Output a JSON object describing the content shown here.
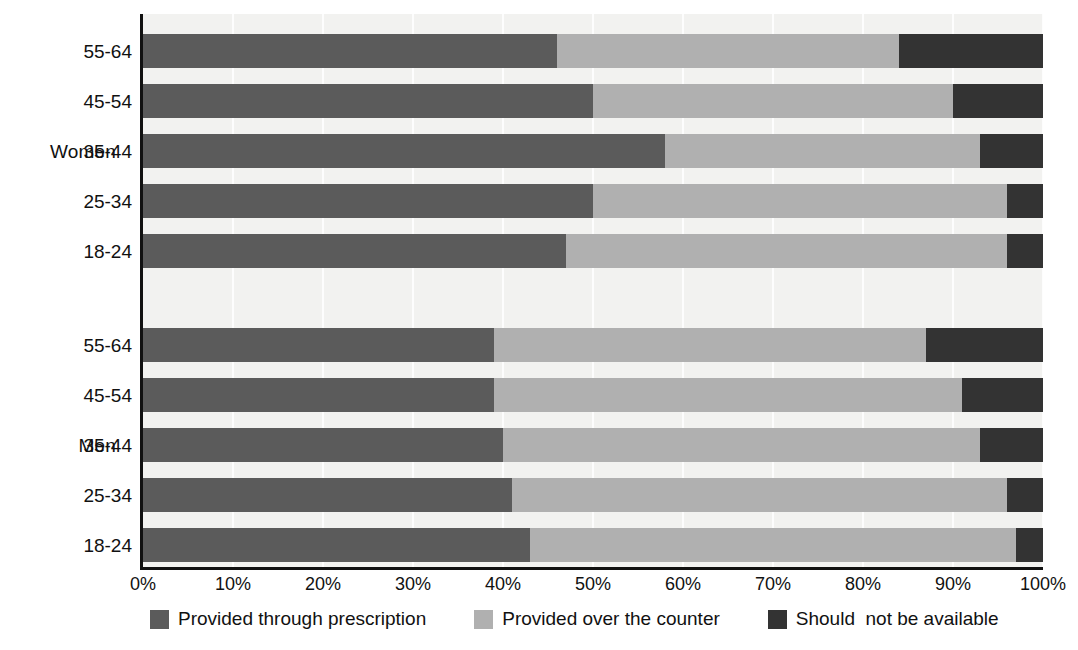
{
  "chart_data": {
    "type": "bar",
    "orientation": "horizontal",
    "stacked": true,
    "stacked_mode": "percent",
    "title": "",
    "subtitle": "",
    "xlabel": "",
    "ylabel": "",
    "xlim": [
      0,
      100
    ],
    "xtick_labels": [
      "0%",
      "10%",
      "20%",
      "30%",
      "40%",
      "50%",
      "60%",
      "70%",
      "80%",
      "90%",
      "100%"
    ],
    "xticks": [
      0,
      10,
      20,
      30,
      40,
      50,
      60,
      70,
      80,
      90,
      100
    ],
    "grid": true,
    "grid_axis": "x",
    "legend_position": "bottom",
    "groups": [
      "Women",
      "Men"
    ],
    "categories": [
      "55-64",
      "45-54",
      "35-44",
      "25-34",
      "18-24"
    ],
    "series": [
      {
        "name": "Provided through prescription",
        "color": "#5b5b5b",
        "values_women": [
          46,
          50,
          58,
          50,
          47
        ],
        "values_men": [
          39,
          39,
          40,
          41,
          43
        ]
      },
      {
        "name": "Provided over the counter",
        "color": "#b0b0b0",
        "values_women": [
          38,
          40,
          35,
          46,
          49
        ],
        "values_men": [
          48,
          52,
          53,
          55,
          54
        ]
      },
      {
        "name": "Should  not be available",
        "color": "#333333",
        "values_women": [
          16,
          10,
          7,
          4,
          4
        ],
        "values_men": [
          13,
          9,
          7,
          4,
          3
        ]
      }
    ],
    "bars": [
      {
        "group": "Women",
        "category": "55-64",
        "segments": [
          46,
          38,
          16
        ]
      },
      {
        "group": "Women",
        "category": "45-54",
        "segments": [
          50,
          40,
          10
        ]
      },
      {
        "group": "Women",
        "category": "35-44",
        "segments": [
          58,
          35,
          7
        ]
      },
      {
        "group": "Women",
        "category": "25-34",
        "segments": [
          50,
          46,
          4
        ]
      },
      {
        "group": "Women",
        "category": "18-24",
        "segments": [
          47,
          49,
          4
        ]
      },
      {
        "group": "Men",
        "category": "55-64",
        "segments": [
          39,
          48,
          13
        ]
      },
      {
        "group": "Men",
        "category": "45-54",
        "segments": [
          39,
          52,
          9
        ]
      },
      {
        "group": "Men",
        "category": "35-44",
        "segments": [
          40,
          53,
          7
        ]
      },
      {
        "group": "Men",
        "category": "25-34",
        "segments": [
          41,
          55,
          4
        ]
      },
      {
        "group": "Men",
        "category": "18-24",
        "segments": [
          43,
          54,
          3
        ]
      }
    ]
  },
  "axis": {
    "ticks": [
      {
        "label": "0%",
        "value": 0
      },
      {
        "label": "10%",
        "value": 10
      },
      {
        "label": "20%",
        "value": 20
      },
      {
        "label": "30%",
        "value": 30
      },
      {
        "label": "40%",
        "value": 40
      },
      {
        "label": "50%",
        "value": 50
      },
      {
        "label": "60%",
        "value": 60
      },
      {
        "label": "70%",
        "value": 70
      },
      {
        "label": "80%",
        "value": 80
      },
      {
        "label": "90%",
        "value": 90
      },
      {
        "label": "100%",
        "value": 100
      }
    ]
  },
  "groups": [
    {
      "label": "Women"
    },
    {
      "label": "Men"
    }
  ],
  "legend": {
    "items": [
      {
        "label": "Provided through prescription",
        "color": "#5b5b5b",
        "swatch": "legend-swatch-prescription"
      },
      {
        "label": "Provided over the counter",
        "color": "#b0b0b0",
        "swatch": "legend-swatch-counter"
      },
      {
        "label": "Should  not be available",
        "color": "#333333",
        "swatch": "legend-swatch-notavailable"
      }
    ]
  },
  "colors": {
    "prescription": "#5b5b5b",
    "counter": "#b0b0b0",
    "not_available": "#333333",
    "plot_background": "#f2f2f0",
    "axis": "#111111",
    "gridline": "#ffffff"
  }
}
